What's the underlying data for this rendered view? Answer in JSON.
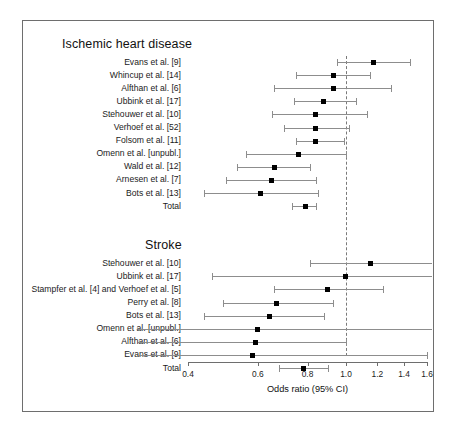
{
  "figure": {
    "type": "forest-plot",
    "axis_title": "Odds ratio (95% CI)",
    "reference_line": 1.0,
    "scale": "log",
    "x_ticks": [
      0.4,
      0.6,
      0.8,
      1.0,
      1.2,
      1.4,
      1.6
    ],
    "x_tick_labels": [
      "0.4",
      "0.6",
      "0.8",
      "1.0",
      "1.2",
      "1.4",
      "1.6"
    ],
    "xlim": [
      0.38,
      1.68
    ]
  },
  "chart_data": {
    "type": "forest",
    "title": "",
    "xlabel": "Odds ratio (95% CI)",
    "ylabel": "",
    "xlim": [
      0.38,
      1.68
    ],
    "xscale": "log",
    "xticks": [
      0.4,
      0.6,
      0.8,
      1.0,
      1.2,
      1.4,
      1.6
    ],
    "reference_line": 1.0,
    "grid": false,
    "legend": "none",
    "groups": [
      {
        "name": "Ischemic heart disease",
        "rows": [
          {
            "label": "Evans et al. [9]",
            "or": 1.17,
            "lo": 0.95,
            "hi": 1.45,
            "total": false
          },
          {
            "label": "Whincup et al. [14]",
            "or": 0.93,
            "lo": 0.75,
            "hi": 1.15,
            "total": false
          },
          {
            "label": "Alfthan et al. [6]",
            "or": 0.93,
            "lo": 0.66,
            "hi": 1.3,
            "total": false
          },
          {
            "label": "Ubbink et al. [17]",
            "or": 0.88,
            "lo": 0.74,
            "hi": 1.06,
            "total": false
          },
          {
            "label": "Stehouwer et al. [10]",
            "or": 0.84,
            "lo": 0.65,
            "hi": 1.13,
            "total": false
          },
          {
            "label": "Verhoef et al. [52]",
            "or": 0.84,
            "lo": 0.7,
            "hi": 1.02,
            "total": false
          },
          {
            "label": "Folsom et al. [11]",
            "or": 0.84,
            "lo": 0.75,
            "hi": 0.99,
            "total": false
          },
          {
            "label": "Omenn et al. [unpubl.]",
            "or": 0.76,
            "lo": 0.56,
            "hi": 1.0,
            "total": false
          },
          {
            "label": "Wald et al. [12]",
            "or": 0.66,
            "lo": 0.53,
            "hi": 0.81,
            "total": false
          },
          {
            "label": "Arnesen et al. [7]",
            "or": 0.65,
            "lo": 0.5,
            "hi": 0.84,
            "total": false
          },
          {
            "label": "Bots et al. [13]",
            "or": 0.61,
            "lo": 0.44,
            "hi": 0.85,
            "total": false
          },
          {
            "label": "Total",
            "or": 0.79,
            "lo": 0.73,
            "hi": 0.84,
            "total": true
          }
        ]
      },
      {
        "name": "Stroke",
        "rows": [
          {
            "label": "Stehouwer et al. [10]",
            "or": 1.15,
            "lo": 0.81,
            "hi": 1.85,
            "total": false,
            "hi_clipped": true
          },
          {
            "label": "Ubbink et al. [17]",
            "or": 1.0,
            "lo": 0.46,
            "hi": 1.9,
            "total": false,
            "hi_clipped": true
          },
          {
            "label": "Stampfer et al. [4] and Verhoef et al. [5]",
            "or": 0.9,
            "lo": 0.66,
            "hi": 1.24,
            "total": false
          },
          {
            "label": "Perry et al. [8]",
            "or": 0.67,
            "lo": 0.49,
            "hi": 0.93,
            "total": false
          },
          {
            "label": "Bots et al. [13]",
            "or": 0.64,
            "lo": 0.44,
            "hi": 0.88,
            "total": false
          },
          {
            "label": "Omenn et al. [unpubl.]",
            "or": 0.6,
            "lo": 0.3,
            "hi": 1.8,
            "total": false,
            "lo_clipped": true,
            "hi_clipped": true
          },
          {
            "label": "Alfthan et al. [6]",
            "or": 0.59,
            "lo": 0.3,
            "hi": 1.0,
            "total": false,
            "lo_clipped": true
          },
          {
            "label": "Evans et al. [9]",
            "or": 0.58,
            "lo": 0.3,
            "hi": 1.6,
            "total": false,
            "lo_clipped": true
          },
          {
            "label": "Total",
            "or": 0.78,
            "lo": 0.68,
            "hi": 0.9,
            "total": true
          }
        ]
      }
    ]
  }
}
